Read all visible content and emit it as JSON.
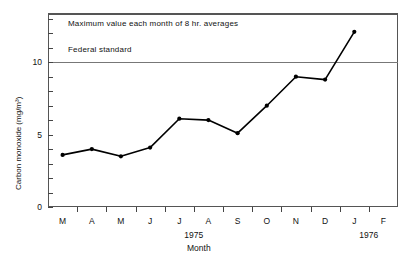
{
  "chart_data": {
    "type": "line",
    "title": "",
    "annotations": [
      {
        "name": "plot-note",
        "text": "Maximum value each month of 8 hr. averages"
      },
      {
        "name": "federal-standard-label",
        "text": "Federal standard",
        "value": 10
      }
    ],
    "xlabel": "Month",
    "ylabel": "Carbon monoxide (mg/m³)",
    "categories": [
      "M",
      "A",
      "M",
      "J",
      "J",
      "A",
      "S",
      "O",
      "N",
      "D",
      "J",
      "F"
    ],
    "group_labels": [
      {
        "text": "1975",
        "after_category_index": 4
      },
      {
        "text": "1976",
        "after_category_index": 10
      }
    ],
    "values": [
      3.6,
      4.0,
      3.5,
      4.1,
      6.1,
      6.0,
      5.1,
      7.0,
      9.0,
      8.8,
      12.1,
      null
    ],
    "ylim": [
      0,
      13.4
    ],
    "yticks_labeled": [
      0,
      5,
      10
    ],
    "ytick_step_minor": 1,
    "grid": false,
    "legend": "none",
    "reference_line": {
      "label": "Federal standard",
      "value": 10,
      "color": "#777777"
    },
    "line_color": "#000000",
    "marker": "circle"
  },
  "colors": {
    "line": "#000000",
    "frame": "#555555",
    "reference": "#777777",
    "text": "#111111",
    "background": "#ffffff"
  }
}
